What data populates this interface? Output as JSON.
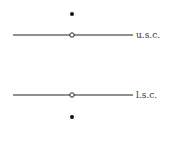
{
  "diagram": {
    "upper": {
      "label": "u.s.c.",
      "line_y": 35,
      "dot_y": 14
    },
    "lower": {
      "label": "l.s.c.",
      "line_y": 95,
      "dot_y": 117
    },
    "line_x_start": 13,
    "line_x_end": 133,
    "point_x": 72,
    "colors": {
      "line": "#222222",
      "dot": "#111111",
      "label": "#333333"
    }
  }
}
